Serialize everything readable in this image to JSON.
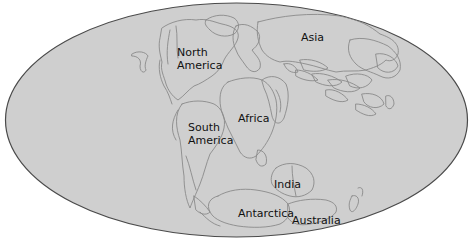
{
  "map": {
    "projection": "Mollweide (oval world map)",
    "colors": {
      "ocean_fill": "#cfcfcf",
      "outline": "#8a8a8a",
      "border": "#4a4a4a",
      "background": "#ffffff",
      "label": "#111111"
    },
    "labels": {
      "north_america": [
        "North",
        "America"
      ],
      "asia": "Asia",
      "africa": "Africa",
      "south_america": [
        "South",
        "America"
      ],
      "india": "India",
      "antarctica": "Antarctica",
      "australia": "Australia"
    }
  }
}
